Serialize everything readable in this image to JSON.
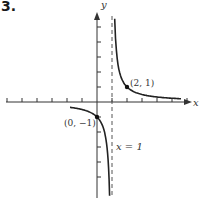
{
  "problem_number": "3.",
  "chart_data": {
    "type": "line",
    "title": "",
    "xlabel": "x",
    "ylabel": "y",
    "function_description": "hyperbola y = 1/(x-1) with vertical asymptote x = 1 and horizontal asymptote y = 0",
    "grid": false,
    "xlim": [
      -6,
      6
    ],
    "ylim": [
      -6,
      6
    ],
    "x_ticks": [
      -6,
      -5,
      -4,
      -3,
      -2,
      -1,
      1,
      2,
      3,
      4,
      5,
      6
    ],
    "y_ticks": [
      -5,
      -4,
      -3,
      -2,
      -1,
      1,
      2,
      3,
      4,
      5
    ],
    "series": [
      {
        "name": "left branch",
        "x": [
          -2,
          -1,
          0,
          0.5,
          0.8
        ],
        "y": [
          -0.33,
          -0.5,
          -1,
          -2,
          -5
        ]
      },
      {
        "name": "right branch",
        "x": [
          1.2,
          1.5,
          2,
          3,
          4,
          5
        ],
        "y": [
          5,
          2,
          1,
          0.5,
          0.33,
          0.25
        ]
      }
    ],
    "points": [
      {
        "label": "(2, 1)",
        "x": 2,
        "y": 1
      },
      {
        "label": "(0, −1)",
        "x": 0,
        "y": -1
      }
    ],
    "asymptotes": [
      {
        "type": "vertical",
        "label": "x = 1",
        "x": 1
      }
    ],
    "colors": {
      "axis": "#333333",
      "curve": "#222222",
      "asymptote": "#555555"
    }
  },
  "labels": {
    "x_axis": "x",
    "y_axis": "y",
    "point_a": "(2, 1)",
    "point_b": "(0, −1)",
    "asymptote": "x = 1"
  }
}
